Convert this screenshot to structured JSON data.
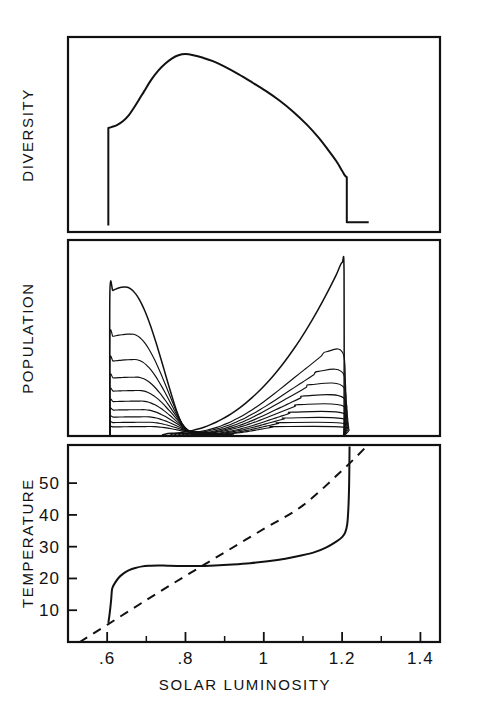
{
  "figure": {
    "background_color": "#ffffff",
    "ink_color": "#111111",
    "xlabel": "SOLAR LUMINOSITY",
    "panel_labels": {
      "top": "DIVERSITY",
      "middle": "POPULATION",
      "bottom": "TEMPERATURE"
    }
  },
  "axis": {
    "x_ticks_major": [
      ".6",
      ".8",
      "1",
      "1.2",
      "1.4"
    ],
    "x_tick_values": [
      0.6,
      0.8,
      1.0,
      1.2,
      1.4
    ],
    "x_ticks_minor": [
      0.5,
      0.7,
      0.9,
      1.1,
      1.3
    ],
    "x_range": [
      0.5,
      1.45
    ],
    "y_ticks_temperature": [
      "10",
      "20",
      "30",
      "40",
      "50"
    ],
    "y_tick_values_temperature": [
      10,
      20,
      30,
      40,
      50
    ],
    "y_range_temperature": [
      0,
      62
    ]
  },
  "chart_data": {
    "type": "line",
    "title": "",
    "subtitle": "",
    "xlabel": "SOLAR LUMINOSITY",
    "ylabel": "",
    "xlim": [
      0.5,
      1.45
    ],
    "grid": false,
    "legend": "none",
    "panels": [
      {
        "name": "diversity",
        "ylabel": "DIVERSITY",
        "ylim": [
          0,
          1.05
        ],
        "yticks_shown": false,
        "series": [
          {
            "name": "diversity",
            "style": "solid",
            "x": [
              0.603,
              0.603,
              0.612,
              0.625,
              0.64,
              0.655,
              0.668,
              0.68,
              0.695,
              0.712,
              0.73,
              0.748,
              0.765,
              0.782,
              0.8,
              0.82,
              0.845,
              0.87,
              0.9,
              0.935,
              0.97,
              1.005,
              1.04,
              1.075,
              1.11,
              1.14,
              1.165,
              1.185,
              1.2,
              1.207,
              1.212,
              1.212,
              1.235,
              1.268
            ],
            "y": [
              0.035,
              0.56,
              0.566,
              0.576,
              0.596,
              0.628,
              0.668,
              0.708,
              0.76,
              0.818,
              0.868,
              0.906,
              0.934,
              0.952,
              0.958,
              0.952,
              0.938,
              0.92,
              0.89,
              0.85,
              0.806,
              0.76,
              0.708,
              0.648,
              0.578,
              0.508,
              0.44,
              0.382,
              0.33,
              0.305,
              0.295,
              0.052,
              0.052,
              0.052
            ]
          }
        ]
      },
      {
        "name": "population",
        "ylabel": "POPULATION",
        "ylim": [
          0,
          1.0
        ],
        "yticks_shown": false,
        "description": "Many overlapping daisy-species population curves; tallest left peak near luminosity 0.64 and tallest right peak near 1.20, with a dense dark band of low-amplitude curves along the baseline.",
        "baseline_y": 0.0,
        "series": [
          {
            "name": "species-1",
            "peak_x": 0.645,
            "peak_y": 0.76,
            "left_x": 0.607,
            "left_y": 0.735,
            "right_x": 0.8,
            "right_y": 0.03
          },
          {
            "name": "species-2",
            "peak_x": 0.66,
            "peak_y": 0.52,
            "left_x": 0.607,
            "left_y": 0.505,
            "right_x": 0.805,
            "right_y": 0.028
          },
          {
            "name": "species-3",
            "peak_x": 0.668,
            "peak_y": 0.39,
            "left_x": 0.607,
            "left_y": 0.38,
            "right_x": 0.808,
            "right_y": 0.026
          },
          {
            "name": "species-4",
            "peak_x": 0.672,
            "peak_y": 0.3,
            "left_x": 0.607,
            "left_y": 0.295,
            "right_x": 0.812,
            "right_y": 0.024
          },
          {
            "name": "species-5",
            "peak_x": 0.678,
            "peak_y": 0.232,
            "left_x": 0.607,
            "left_y": 0.228,
            "right_x": 0.815,
            "right_y": 0.022
          },
          {
            "name": "species-6",
            "peak_x": 0.682,
            "peak_y": 0.178,
            "left_x": 0.607,
            "left_y": 0.175,
            "right_x": 0.818,
            "right_y": 0.02
          },
          {
            "name": "species-7",
            "peak_x": 0.686,
            "peak_y": 0.134,
            "left_x": 0.607,
            "left_y": 0.132,
            "right_x": 0.822,
            "right_y": 0.018
          },
          {
            "name": "species-8",
            "peak_x": 0.69,
            "peak_y": 0.098,
            "left_x": 0.607,
            "left_y": 0.096,
            "right_x": 0.826,
            "right_y": 0.016
          },
          {
            "name": "species-9",
            "peak_x": 0.694,
            "peak_y": 0.07,
            "left_x": 0.607,
            "left_y": 0.068,
            "right_x": 0.83,
            "right_y": 0.014
          },
          {
            "name": "species-10",
            "peak_x": 0.698,
            "peak_y": 0.048,
            "left_x": 0.607,
            "left_y": 0.046,
            "right_x": 0.834,
            "right_y": 0.012
          },
          {
            "name": "species-r1",
            "peak_x": 1.2,
            "peak_y": 0.885,
            "left_x": 0.74,
            "left_y": 0.012,
            "right_x": 1.205,
            "right_y": 0.0
          },
          {
            "name": "species-r2",
            "peak_x": 1.16,
            "peak_y": 0.43,
            "left_x": 0.76,
            "left_y": 0.012,
            "right_x": 1.205,
            "right_y": 0.0
          },
          {
            "name": "species-r3",
            "peak_x": 1.14,
            "peak_y": 0.33,
            "left_x": 0.77,
            "left_y": 0.012,
            "right_x": 1.205,
            "right_y": 0.0
          },
          {
            "name": "species-r4",
            "peak_x": 1.12,
            "peak_y": 0.262,
            "left_x": 0.78,
            "left_y": 0.01,
            "right_x": 1.205,
            "right_y": 0.0
          },
          {
            "name": "species-r5",
            "peak_x": 1.105,
            "peak_y": 0.205,
            "left_x": 0.79,
            "left_y": 0.01,
            "right_x": 1.205,
            "right_y": 0.0
          },
          {
            "name": "species-r6",
            "peak_x": 1.09,
            "peak_y": 0.16,
            "left_x": 0.8,
            "left_y": 0.01,
            "right_x": 1.205,
            "right_y": 0.0
          },
          {
            "name": "species-r7",
            "peak_x": 1.075,
            "peak_y": 0.122,
            "left_x": 0.812,
            "left_y": 0.008,
            "right_x": 1.205,
            "right_y": 0.0
          },
          {
            "name": "species-r8",
            "peak_x": 1.06,
            "peak_y": 0.092,
            "left_x": 0.824,
            "left_y": 0.008,
            "right_x": 1.205,
            "right_y": 0.0
          },
          {
            "name": "species-r9",
            "peak_x": 1.045,
            "peak_y": 0.068,
            "left_x": 0.836,
            "left_y": 0.006,
            "right_x": 1.205,
            "right_y": 0.0
          },
          {
            "name": "species-r10",
            "peak_x": 1.03,
            "peak_y": 0.048,
            "left_x": 0.848,
            "left_y": 0.006,
            "right_x": 1.205,
            "right_y": 0.0
          }
        ]
      },
      {
        "name": "temperature",
        "ylabel": "TEMPERATURE",
        "ylim": [
          0,
          62
        ],
        "yticks_shown": true,
        "series": [
          {
            "name": "regulated-temperature",
            "style": "solid",
            "x": [
              0.603,
              0.606,
              0.61,
              0.612,
              0.614,
              0.62,
              0.63,
              0.642,
              0.656,
              0.672,
              0.69,
              0.71,
              0.73,
              0.755,
              0.79,
              0.83,
              0.875,
              0.92,
              0.965,
              1.01,
              1.055,
              1.095,
              1.13,
              1.16,
              1.185,
              1.2,
              1.208,
              1.213,
              1.216,
              1.218,
              1.219
            ],
            "y": [
              6.0,
              8.5,
              13.0,
              16.2,
              17.2,
              18.6,
              20.3,
              21.6,
              22.6,
              23.3,
              23.8,
              24.0,
              24.1,
              24.0,
              23.9,
              23.9,
              24.1,
              24.4,
              24.8,
              25.4,
              26.2,
              27.2,
              28.3,
              29.8,
              31.6,
              33.0,
              34.5,
              37.0,
              42.0,
              50.0,
              61.5
            ]
          },
          {
            "name": "barren-planet-temperature",
            "style": "dashed",
            "x": [
              0.53,
              0.6,
              0.7,
              0.8,
              0.9,
              1.0,
              1.1,
              1.2,
              1.262
            ],
            "y": [
              0.0,
              5.4,
              13.2,
              20.8,
              28.2,
              35.6,
              43.0,
              54.0,
              61.5
            ]
          }
        ]
      }
    ]
  }
}
